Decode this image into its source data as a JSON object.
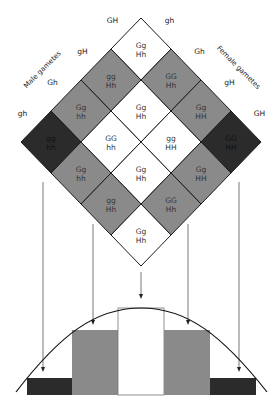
{
  "punnett": {
    "male_title": "Male gametes",
    "female_title": "Female gametes",
    "male_gametes": [
      "GH",
      "gH",
      "Gh",
      "gh"
    ],
    "female_gametes": [
      "gh",
      "Gh",
      "gH",
      "GH"
    ],
    "cells": [
      [
        {
          "g": "Gg",
          "h": "Hh"
        },
        {
          "g": "GG",
          "h": "Hh"
        },
        {
          "g": "Gg",
          "h": "HH"
        },
        {
          "g": "GG",
          "h": "HH"
        }
      ],
      [
        {
          "g": "gg",
          "h": "Hh"
        },
        {
          "g": "Gg",
          "h": "Hh"
        },
        {
          "g": "gg",
          "h": "HH"
        },
        {
          "g": "Gg",
          "h": "HH"
        }
      ],
      [
        {
          "g": "Gg",
          "h": "hh"
        },
        {
          "g": "GG",
          "h": "hh"
        },
        {
          "g": "Gg",
          "h": "Hh"
        },
        {
          "g": "GG",
          "h": "Hh"
        }
      ],
      [
        {
          "g": "gg",
          "h": "hh"
        },
        {
          "g": "Gg",
          "h": "hh"
        },
        {
          "g": "gg",
          "h": "Hh"
        },
        {
          "g": "Gg",
          "h": "Hh"
        }
      ]
    ]
  },
  "colors": {
    "dark": "#2b2b2b",
    "gray": "#8a8a8a",
    "white": "#ffffff",
    "line": "#1a1a1a",
    "arrow": "#555555"
  },
  "histogram": {
    "classes": [
      "0 or 4 dominant (dark)",
      "1 or 3 dominant (gray)",
      "2 dominant (white)",
      "1 or 3 dominant (gray)",
      "0 or 4 dominant (dark)"
    ],
    "relative_heights": [
      1,
      4,
      6,
      4,
      1
    ]
  }
}
